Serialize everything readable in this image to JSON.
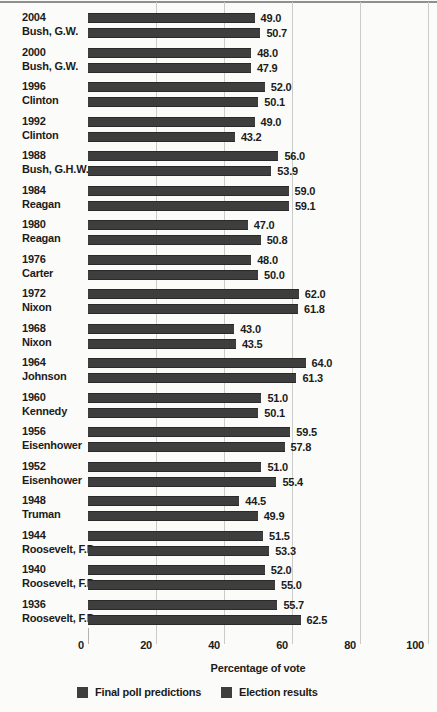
{
  "chart_data": {
    "type": "bar",
    "orientation": "horizontal",
    "title": "",
    "xlabel": "Percentage of vote",
    "xlim": [
      0,
      100
    ],
    "x_ticks": [
      0,
      20,
      40,
      60,
      80,
      100
    ],
    "grid": "vertical-on",
    "legend_position": "bottom",
    "legend": [
      {
        "name": "Final poll predictions",
        "color": "#3e3e3e"
      },
      {
        "name": "Election results",
        "color": "#3e3e3e"
      }
    ],
    "series_note": "poll = Final poll predictions (top bar), result = Election results (bottom bar)",
    "rows": [
      {
        "year": "2004",
        "candidate": "Bush, G.W.",
        "poll": 49.0,
        "result": 50.7
      },
      {
        "year": "2000",
        "candidate": "Bush, G.W.",
        "poll": 48.0,
        "result": 47.9
      },
      {
        "year": "1996",
        "candidate": "Clinton",
        "poll": 52.0,
        "result": 50.1
      },
      {
        "year": "1992",
        "candidate": "Clinton",
        "poll": 49.0,
        "result": 43.2
      },
      {
        "year": "1988",
        "candidate": "Bush, G.H.W.",
        "poll": 56.0,
        "result": 53.9
      },
      {
        "year": "1984",
        "candidate": "Reagan",
        "poll": 59.0,
        "result": 59.1
      },
      {
        "year": "1980",
        "candidate": "Reagan",
        "poll": 47.0,
        "result": 50.8
      },
      {
        "year": "1976",
        "candidate": "Carter",
        "poll": 48.0,
        "result": 50.0
      },
      {
        "year": "1972",
        "candidate": "Nixon",
        "poll": 62.0,
        "result": 61.8
      },
      {
        "year": "1968",
        "candidate": "Nixon",
        "poll": 43.0,
        "result": 43.5
      },
      {
        "year": "1964",
        "candidate": "Johnson",
        "poll": 64.0,
        "result": 61.3
      },
      {
        "year": "1960",
        "candidate": "Kennedy",
        "poll": 51.0,
        "result": 50.1
      },
      {
        "year": "1956",
        "candidate": "Eisenhower",
        "poll": 59.5,
        "result": 57.8
      },
      {
        "year": "1952",
        "candidate": "Eisenhower",
        "poll": 51.0,
        "result": 55.4
      },
      {
        "year": "1948",
        "candidate": "Truman",
        "poll": 44.5,
        "result": 49.9
      },
      {
        "year": "1944",
        "candidate": "Roosevelt, F.D.",
        "poll": 51.5,
        "result": 53.3
      },
      {
        "year": "1940",
        "candidate": "Roosevelt, F.D.",
        "poll": 52.0,
        "result": 55.0
      },
      {
        "year": "1936",
        "candidate": "Roosevelt, F.D.",
        "poll": 55.7,
        "result": 62.5
      }
    ]
  },
  "colors": {
    "bar": "#3e3e3e",
    "bar_edge": "#2a2a2a",
    "gridline": "#cbcbc9",
    "top_rule": "#8f8f8f",
    "background": "#fbfbf9",
    "text": "#1b1b1b"
  }
}
